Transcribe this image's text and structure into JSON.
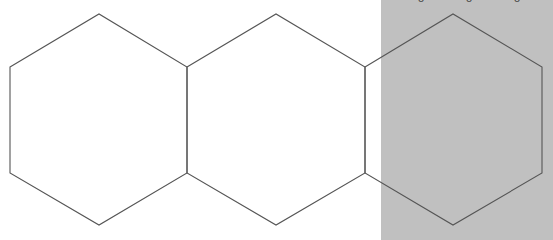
{
  "canvas": {
    "width": 553,
    "height": 240,
    "background_color": "#ffffff"
  },
  "overlay_panel": {
    "name": "gray-right-panel",
    "fill_color": "#c0c0c0",
    "left": 381,
    "top": 0,
    "width": 172,
    "height": 240
  },
  "stroke": {
    "color": "#555555",
    "width": 1.1
  },
  "hexagons": [
    {
      "id": "hexagon-left",
      "label": "Left hexagon",
      "center_x": 99,
      "center_y": 120,
      "points": "10,67 99,14 187,67 187,173 99,225 10,173",
      "fill": "none"
    },
    {
      "id": "hexagon-middle",
      "label": "Middle hexagon",
      "center_x": 276,
      "center_y": 120,
      "points": "187,67 276,14 365,67 365,173 276,225 187,173",
      "fill": "none"
    },
    {
      "id": "hexagon-right",
      "label": "Right hexagon",
      "center_x": 453,
      "center_y": 120,
      "points": "365,67 453,14 542,67 542,173 453,225 365,173",
      "fill": "none"
    }
  ],
  "clipped_top_glyphs": [
    {
      "x": 417,
      "text": "o"
    },
    {
      "x": 465,
      "text": "o"
    },
    {
      "x": 513,
      "text": "o"
    }
  ]
}
